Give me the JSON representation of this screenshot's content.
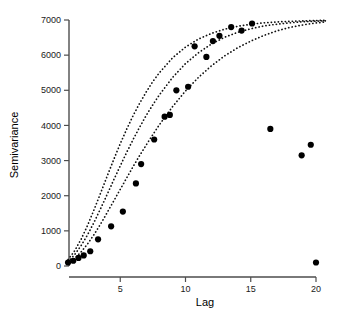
{
  "chart_data": {
    "type": "scatter",
    "title": "",
    "xlabel": "Lag",
    "ylabel": "Semivariance",
    "xlim": [
      0,
      21
    ],
    "ylim": [
      0,
      7000
    ],
    "xticks": [
      5,
      10,
      15,
      20
    ],
    "xtick_labels": [
      "5",
      "10",
      "15",
      "20"
    ],
    "yticks": [
      0,
      1000,
      2000,
      3000,
      4000,
      5000,
      6000,
      7000
    ],
    "ytick_labels": [
      "0",
      "1000",
      "2000",
      "3000",
      "4000",
      "5000",
      "6000",
      "7000"
    ],
    "grid": false,
    "legend": "none",
    "points": [
      {
        "x": 1.0,
        "y": 100
      },
      {
        "x": 1.4,
        "y": 150
      },
      {
        "x": 1.8,
        "y": 230
      },
      {
        "x": 2.2,
        "y": 300
      },
      {
        "x": 2.7,
        "y": 420
      },
      {
        "x": 3.3,
        "y": 760
      },
      {
        "x": 4.3,
        "y": 1130
      },
      {
        "x": 5.2,
        "y": 1550
      },
      {
        "x": 6.2,
        "y": 2350
      },
      {
        "x": 6.6,
        "y": 2900
      },
      {
        "x": 7.6,
        "y": 3600
      },
      {
        "x": 8.4,
        "y": 4250
      },
      {
        "x": 8.8,
        "y": 4300
      },
      {
        "x": 9.3,
        "y": 5000
      },
      {
        "x": 10.2,
        "y": 5100
      },
      {
        "x": 10.7,
        "y": 6250
      },
      {
        "x": 11.6,
        "y": 5950
      },
      {
        "x": 12.1,
        "y": 6400
      },
      {
        "x": 12.6,
        "y": 6550
      },
      {
        "x": 13.5,
        "y": 6800
      },
      {
        "x": 14.3,
        "y": 6700
      },
      {
        "x": 15.1,
        "y": 6900
      },
      {
        "x": 16.5,
        "y": 3900
      },
      {
        "x": 18.9,
        "y": 3150
      },
      {
        "x": 19.6,
        "y": 3450
      },
      {
        "x": 20.0,
        "y": 100
      }
    ],
    "series": [
      {
        "name": "model-curve-short-range",
        "model": "exponential",
        "sill": 7000,
        "range": 7.2,
        "values": [
          {
            "x": 1.0,
            "y": 180
          },
          {
            "x": 1.5,
            "y": 430
          },
          {
            "x": 2.0,
            "y": 760
          },
          {
            "x": 2.5,
            "y": 1160
          },
          {
            "x": 3.0,
            "y": 1610
          },
          {
            "x": 3.5,
            "y": 2080
          },
          {
            "x": 4.0,
            "y": 2560
          },
          {
            "x": 4.5,
            "y": 3030
          },
          {
            "x": 5.0,
            "y": 3480
          },
          {
            "x": 5.5,
            "y": 3900
          },
          {
            "x": 6.0,
            "y": 4290
          },
          {
            "x": 6.5,
            "y": 4640
          },
          {
            "x": 7.0,
            "y": 4960
          },
          {
            "x": 7.5,
            "y": 5250
          },
          {
            "x": 8.0,
            "y": 5500
          },
          {
            "x": 9.0,
            "y": 5920
          },
          {
            "x": 10.0,
            "y": 6230
          },
          {
            "x": 11.0,
            "y": 6460
          },
          {
            "x": 12.0,
            "y": 6620
          },
          {
            "x": 13.0,
            "y": 6740
          },
          {
            "x": 14.0,
            "y": 6820
          },
          {
            "x": 15.0,
            "y": 6880
          },
          {
            "x": 16.0,
            "y": 6920
          },
          {
            "x": 17.0,
            "y": 6945
          },
          {
            "x": 18.0,
            "y": 6962
          },
          {
            "x": 19.0,
            "y": 6975
          },
          {
            "x": 20.0,
            "y": 6985
          },
          {
            "x": 20.8,
            "y": 6990
          }
        ]
      },
      {
        "name": "model-curve-mid-range",
        "model": "exponential",
        "sill": 7000,
        "range": 9.2,
        "values": [
          {
            "x": 1.0,
            "y": 120
          },
          {
            "x": 1.5,
            "y": 320
          },
          {
            "x": 2.0,
            "y": 580
          },
          {
            "x": 2.5,
            "y": 890
          },
          {
            "x": 3.0,
            "y": 1250
          },
          {
            "x": 3.5,
            "y": 1640
          },
          {
            "x": 4.0,
            "y": 2040
          },
          {
            "x": 4.5,
            "y": 2450
          },
          {
            "x": 5.0,
            "y": 2850
          },
          {
            "x": 5.5,
            "y": 3240
          },
          {
            "x": 6.0,
            "y": 3610
          },
          {
            "x": 6.5,
            "y": 3960
          },
          {
            "x": 7.0,
            "y": 4290
          },
          {
            "x": 7.5,
            "y": 4590
          },
          {
            "x": 8.0,
            "y": 4870
          },
          {
            "x": 9.0,
            "y": 5360
          },
          {
            "x": 10.0,
            "y": 5760
          },
          {
            "x": 11.0,
            "y": 6070
          },
          {
            "x": 12.0,
            "y": 6320
          },
          {
            "x": 13.0,
            "y": 6510
          },
          {
            "x": 14.0,
            "y": 6650
          },
          {
            "x": 15.0,
            "y": 6750
          },
          {
            "x": 16.0,
            "y": 6830
          },
          {
            "x": 17.0,
            "y": 6880
          },
          {
            "x": 18.0,
            "y": 6920
          },
          {
            "x": 19.0,
            "y": 6950
          },
          {
            "x": 20.0,
            "y": 6968
          },
          {
            "x": 20.8,
            "y": 6978
          }
        ]
      },
      {
        "name": "model-curve-long-range",
        "model": "exponential",
        "sill": 7000,
        "range": 12.0,
        "values": [
          {
            "x": 1.0,
            "y": 80
          },
          {
            "x": 1.5,
            "y": 210
          },
          {
            "x": 2.0,
            "y": 400
          },
          {
            "x": 2.5,
            "y": 630
          },
          {
            "x": 3.0,
            "y": 900
          },
          {
            "x": 3.5,
            "y": 1200
          },
          {
            "x": 4.0,
            "y": 1520
          },
          {
            "x": 4.5,
            "y": 1850
          },
          {
            "x": 5.0,
            "y": 2180
          },
          {
            "x": 5.5,
            "y": 2510
          },
          {
            "x": 6.0,
            "y": 2840
          },
          {
            "x": 6.5,
            "y": 3150
          },
          {
            "x": 7.0,
            "y": 3450
          },
          {
            "x": 7.5,
            "y": 3740
          },
          {
            "x": 8.0,
            "y": 4020
          },
          {
            "x": 9.0,
            "y": 4530
          },
          {
            "x": 10.0,
            "y": 4980
          },
          {
            "x": 11.0,
            "y": 5370
          },
          {
            "x": 12.0,
            "y": 5700
          },
          {
            "x": 13.0,
            "y": 5980
          },
          {
            "x": 14.0,
            "y": 6210
          },
          {
            "x": 15.0,
            "y": 6400
          },
          {
            "x": 16.0,
            "y": 6560
          },
          {
            "x": 17.0,
            "y": 6690
          },
          {
            "x": 18.0,
            "y": 6790
          },
          {
            "x": 19.0,
            "y": 6860
          },
          {
            "x": 20.0,
            "y": 6915
          },
          {
            "x": 20.8,
            "y": 6948
          }
        ]
      }
    ]
  }
}
